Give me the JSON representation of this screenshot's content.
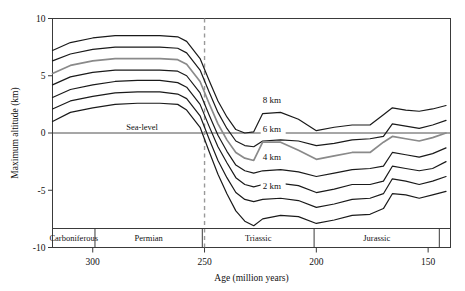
{
  "chart_data": {
    "type": "line",
    "title": "",
    "xlabel": "Age (million years)",
    "ylabel": "Maximum altitude (km)",
    "xlim": [
      318,
      140
    ],
    "ylim": [
      -10,
      10
    ],
    "x_ticks": [
      300,
      250,
      200,
      150
    ],
    "y_ticks": [
      10,
      5,
      0,
      -5,
      -10
    ],
    "x_axis_reversed": true,
    "grid": false,
    "legend": "inline-labels",
    "annotations": [
      {
        "name": "sea-level",
        "text": "Sea-level",
        "y": 0,
        "x": 285
      },
      {
        "name": "pt-boundary",
        "text": "",
        "x": 250,
        "style": "dashed-vertical",
        "color": "#999999"
      }
    ],
    "x": [
      318,
      310,
      300,
      290,
      280,
      270,
      262,
      258,
      252,
      248,
      244,
      240,
      236,
      232,
      228,
      224,
      216,
      208,
      200,
      192,
      184,
      176,
      170,
      166,
      160,
      154,
      148,
      142
    ],
    "series": [
      {
        "name": "curve-1",
        "label": "",
        "color": "#1a1a1a",
        "values": [
          7.2,
          7.9,
          8.3,
          8.5,
          8.5,
          8.5,
          8.4,
          8.0,
          6.5,
          4.6,
          2.8,
          1.4,
          0.3,
          0.0,
          0.1,
          1.7,
          1.8,
          1.2,
          0.2,
          0.5,
          0.7,
          0.7,
          1.6,
          2.2,
          2.0,
          1.9,
          2.1,
          2.4
        ]
      },
      {
        "name": "curve-2",
        "label": "8 km",
        "color": "#1a1a1a",
        "values": [
          6.3,
          6.9,
          7.3,
          7.5,
          7.5,
          7.5,
          7.4,
          7.0,
          5.5,
          3.6,
          1.8,
          0.4,
          -0.7,
          -1.1,
          -1.2,
          -0.7,
          -0.6,
          -0.7,
          -1.1,
          -0.9,
          -0.6,
          -0.5,
          -0.3,
          0.8,
          0.6,
          0.4,
          0.7,
          1.1
        ]
      },
      {
        "name": "curve-3",
        "label": "6 km",
        "color": "#8a8a8a",
        "values": [
          5.2,
          5.9,
          6.3,
          6.5,
          6.5,
          6.5,
          6.4,
          6.0,
          4.5,
          2.6,
          0.8,
          -0.6,
          -1.7,
          -2.2,
          -2.4,
          -0.8,
          -0.8,
          -1.5,
          -2.3,
          -2.0,
          -1.7,
          -1.7,
          -0.8,
          -0.3,
          -0.5,
          -0.7,
          -0.4,
          0.0
        ]
      },
      {
        "name": "curve-4",
        "label": "",
        "color": "#1a1a1a",
        "values": [
          4.2,
          4.9,
          5.3,
          5.5,
          5.5,
          5.5,
          5.4,
          5.0,
          3.5,
          1.6,
          -0.2,
          -1.6,
          -2.8,
          -3.3,
          -3.5,
          -3.3,
          -3.2,
          -3.4,
          -3.8,
          -3.5,
          -3.2,
          -3.1,
          -2.9,
          -1.7,
          -1.9,
          -2.1,
          -1.8,
          -1.3
        ]
      },
      {
        "name": "curve-5",
        "label": "4 km",
        "color": "#1a1a1a",
        "values": [
          3.1,
          3.8,
          4.2,
          4.5,
          4.6,
          4.6,
          4.4,
          4.0,
          2.5,
          0.6,
          -1.2,
          -2.6,
          -3.9,
          -4.5,
          -4.7,
          -4.5,
          -4.4,
          -4.6,
          -5.2,
          -4.9,
          -4.5,
          -4.5,
          -4.2,
          -2.9,
          -3.1,
          -3.3,
          -3.1,
          -2.5
        ]
      },
      {
        "name": "curve-6",
        "label": "",
        "color": "#1a1a1a",
        "values": [
          2.1,
          2.8,
          3.2,
          3.5,
          3.6,
          3.6,
          3.4,
          3.0,
          1.5,
          -0.5,
          -2.4,
          -3.9,
          -5.2,
          -5.8,
          -6.0,
          -5.8,
          -5.7,
          -5.9,
          -6.5,
          -6.2,
          -5.8,
          -5.7,
          -5.3,
          -4.0,
          -4.2,
          -4.5,
          -4.2,
          -3.8
        ]
      },
      {
        "name": "curve-7",
        "label": "2 km",
        "color": "#1a1a1a",
        "values": [
          1.0,
          1.8,
          2.2,
          2.5,
          2.6,
          2.6,
          2.5,
          2.0,
          0.5,
          -1.6,
          -3.6,
          -5.3,
          -6.8,
          -7.7,
          -8.1,
          -7.5,
          -7.2,
          -7.3,
          -7.9,
          -7.6,
          -7.2,
          -7.1,
          -6.6,
          -5.3,
          -5.4,
          -5.7,
          -5.4,
          -5.1
        ]
      }
    ],
    "series_labels": [
      {
        "name": "label-8km",
        "text": "8 km",
        "x": 224,
        "y": 2.6
      },
      {
        "name": "label-6km",
        "text": "6 km",
        "x": 224,
        "y": 0.1
      },
      {
        "name": "label-4km",
        "text": "4 km",
        "x": 224,
        "y": -2.4
      },
      {
        "name": "label-2km",
        "text": "2 km",
        "x": 224,
        "y": -4.9
      }
    ],
    "period_bands": [
      {
        "name": "carboniferous",
        "label": "Carboniferous",
        "start": 318,
        "end": 299
      },
      {
        "name": "permian",
        "label": "Permian",
        "start": 299,
        "end": 251
      },
      {
        "name": "triassic",
        "label": "Triassic",
        "start": 251,
        "end": 201
      },
      {
        "name": "jurassic",
        "label": "Jurassic",
        "start": 201,
        "end": 145
      },
      {
        "name": "cretaceous",
        "label": "",
        "start": 145,
        "end": 140
      }
    ]
  }
}
